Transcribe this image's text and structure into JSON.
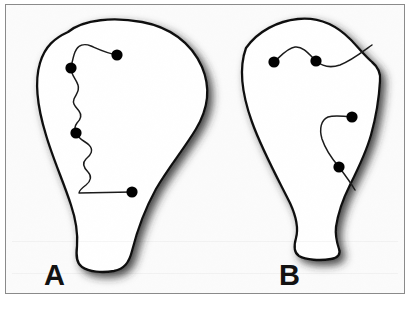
{
  "figure": {
    "type": "scientific-line-drawing",
    "panel_count": 2,
    "background_color": "#fbfbfb",
    "frame_border_color": "#8a8a8a",
    "outline_color": "#111111",
    "trace_color": "#1a1a1a",
    "marker_color": "#000000",
    "shadow_color": "#3a3a3a",
    "panels": [
      {
        "id": "A",
        "label": "A",
        "description": "teardrop outline with wandering zig-zag trace",
        "marker_count": 3,
        "trace_count": 1,
        "markers": [
          {
            "name": "marker-a1",
            "x": 111,
            "y": 50
          },
          {
            "name": "marker-a2",
            "x": 65,
            "y": 63
          },
          {
            "name": "marker-a3",
            "x": 70,
            "y": 128
          }
        ],
        "trace_terminal": {
          "name": "marker-a4",
          "x": 126,
          "y": 187
        }
      },
      {
        "id": "B",
        "label": "B",
        "description": "teardrop outline with two smooth traces",
        "marker_count": 4,
        "trace_count": 2,
        "markers": [
          {
            "name": "marker-b1",
            "x": 268,
            "y": 57
          },
          {
            "name": "marker-b2",
            "x": 310,
            "y": 56
          },
          {
            "name": "marker-b3",
            "x": 346,
            "y": 112
          },
          {
            "name": "marker-b4",
            "x": 333,
            "y": 162
          }
        ]
      }
    ]
  }
}
